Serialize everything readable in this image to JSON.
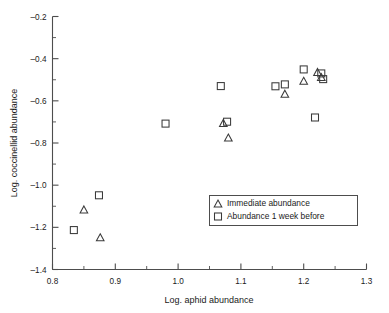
{
  "chart_data": {
    "type": "scatter",
    "title": "",
    "xlabel": "Log. aphid abundance",
    "ylabel": "Log. coccinellid abundance",
    "xlim": [
      0.8,
      1.3
    ],
    "ylim": [
      -1.4,
      -0.2
    ],
    "xticks": [
      0.8,
      0.9,
      1.0,
      1.1,
      1.2,
      1.3
    ],
    "xticklabels": [
      "0.8",
      "0.9",
      "1.0",
      "1.1",
      "1.2",
      "1.3"
    ],
    "xminorticks": [
      0.85,
      0.95,
      1.05,
      1.15,
      1.25
    ],
    "yticks": [
      -0.2,
      -0.4,
      -0.6,
      -0.8,
      -1.0,
      -1.2,
      -1.4
    ],
    "yticklabels": [
      "-0.2",
      "-0.4",
      "-0.6",
      "-0.8",
      "-1.0",
      "-1.2",
      "-1.4"
    ],
    "yminorticks": [
      -0.3,
      -0.5,
      -0.7,
      -0.9,
      -1.1,
      -1.3
    ],
    "grid": false,
    "legend_position": "lower right",
    "series": [
      {
        "name": "Immediate abundance",
        "marker": "triangle",
        "points": [
          {
            "x": 0.85,
            "y": -1.115
          },
          {
            "x": 0.876,
            "y": -1.247
          },
          {
            "x": 1.072,
            "y": -0.705
          },
          {
            "x": 1.08,
            "y": -0.774
          },
          {
            "x": 1.17,
            "y": -0.566
          },
          {
            "x": 1.2,
            "y": -0.505
          },
          {
            "x": 1.222,
            "y": -0.463
          },
          {
            "x": 1.228,
            "y": -0.487
          }
        ]
      },
      {
        "name": "Abundance 1 week before",
        "marker": "square",
        "points": [
          {
            "x": 0.834,
            "y": -1.213
          },
          {
            "x": 0.874,
            "y": -1.048
          },
          {
            "x": 0.98,
            "y": -0.708
          },
          {
            "x": 1.068,
            "y": -0.53
          },
          {
            "x": 1.078,
            "y": -0.699
          },
          {
            "x": 1.155,
            "y": -0.531
          },
          {
            "x": 1.17,
            "y": -0.522
          },
          {
            "x": 1.2,
            "y": -0.451
          },
          {
            "x": 1.218,
            "y": -0.679
          },
          {
            "x": 1.228,
            "y": -0.47
          },
          {
            "x": 1.231,
            "y": -0.497
          }
        ]
      }
    ]
  },
  "legend": {
    "entries": [
      {
        "label": "Immediate abundance",
        "marker": "triangle"
      },
      {
        "label": "Abundance 1 week before",
        "marker": "square"
      }
    ]
  },
  "colors": {
    "axis": "#4d4d4d",
    "marker": "#3a3a3a",
    "text": "#1a1a1a",
    "background": "#ffffff"
  }
}
